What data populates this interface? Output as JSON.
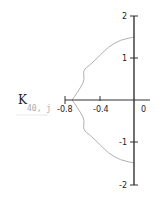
{
  "chart_data": {
    "type": "line",
    "title": "",
    "xlabel": "",
    "ylabel": "K",
    "ylabel_subscript": "40, j",
    "xlim": [
      -0.85,
      0.1
    ],
    "ylim": [
      -2,
      2
    ],
    "x_ticks": [
      -0.8,
      -0.4,
      0
    ],
    "x_tick_labels": [
      "-0.8",
      "-0.4",
      "0"
    ],
    "y_ticks": [
      2,
      1,
      -1,
      -2
    ],
    "y_tick_labels": [
      "2",
      "1",
      "-1",
      "-2"
    ],
    "grid": false,
    "legend": null,
    "axes_style": "crossing at origin",
    "series": [
      {
        "name": "K_40,j",
        "color": "#b0b0b0",
        "x": [
          0.0,
          -0.16,
          -0.3,
          -0.39,
          -0.51,
          -0.59,
          -0.57,
          -0.62,
          -0.69,
          -0.72,
          -0.69,
          -0.62,
          -0.57,
          -0.59,
          -0.51,
          -0.39,
          -0.3,
          -0.16,
          0.0
        ],
        "y": [
          1.5,
          1.43,
          1.26,
          1.07,
          0.83,
          0.71,
          0.48,
          0.29,
          0.07,
          0.0,
          -0.07,
          -0.29,
          -0.48,
          -0.71,
          -0.83,
          -1.07,
          -1.26,
          -1.43,
          -1.5
        ]
      }
    ]
  },
  "axis": {
    "color": "#333333",
    "curve_color": "#b0b0b0"
  },
  "labels": {
    "ylabel_main": "K",
    "ylabel_sub": "40, j",
    "x_ticks": [
      "-0.8",
      "-0.4",
      "0"
    ],
    "y_ticks": [
      "2",
      "1",
      "-1",
      "-2"
    ]
  }
}
